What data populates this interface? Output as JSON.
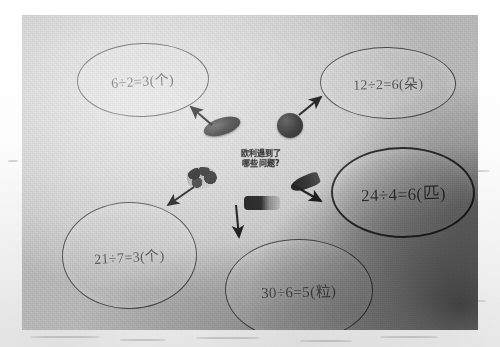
{
  "image": {
    "kind": "photograph-of-handwritten-whiteboard-mindmap",
    "subject": "division word-problem mind map",
    "paper_color": "#d9d9d9",
    "ink_color": "#2c2c2c"
  },
  "center": {
    "prompt_line1": "欧利遇到了",
    "prompt_line2": "哪些问题?"
  },
  "bubbles": [
    {
      "id": "bubble-6-2",
      "name": "bubble-equation-top-left",
      "equation": "6÷2=3(个)",
      "position": "top-left"
    },
    {
      "id": "bubble-12-2",
      "name": "bubble-equation-top-right",
      "equation": "12÷2=6(朵)",
      "position": "top-right"
    },
    {
      "id": "bubble-24-4",
      "name": "bubble-equation-right",
      "equation": "24÷4=6(匹)",
      "position": "middle-right"
    },
    {
      "id": "bubble-21-7",
      "name": "bubble-equation-bottom-left",
      "equation": "21÷7=3(个)",
      "position": "bottom-left"
    },
    {
      "id": "bubble-30-6",
      "name": "bubble-equation-bottom-center",
      "equation": "30÷6=5(粒)",
      "position": "bottom-center"
    }
  ],
  "objects": [
    {
      "id": "obj-sausage",
      "name": "dark-oval-object"
    },
    {
      "id": "obj-ball",
      "name": "dark-round-object"
    },
    {
      "id": "obj-cluster",
      "name": "dark-cluster-object"
    },
    {
      "id": "obj-carrot",
      "name": "dark-elongated-object"
    },
    {
      "id": "obj-bar",
      "name": "dark-bar-object"
    }
  ],
  "arrows": [
    {
      "name": "arrow-to-top-left",
      "direction": "up-left"
    },
    {
      "name": "arrow-to-top-right",
      "direction": "up-right"
    },
    {
      "name": "arrow-to-bottom-left",
      "direction": "down-left"
    },
    {
      "name": "arrow-to-right",
      "direction": "right-down"
    },
    {
      "name": "arrow-to-bottom-center",
      "direction": "down"
    }
  ]
}
